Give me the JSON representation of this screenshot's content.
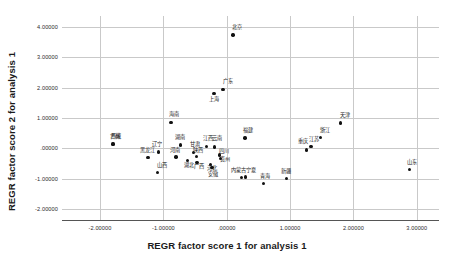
{
  "chart_data": {
    "type": "scatter",
    "title": "",
    "xlabel": "REGR factor score  1 for analysis 1",
    "ylabel": "REGR factor score  2 for analysis 1",
    "xlim": [
      -2.6,
      3.35
    ],
    "ylim": [
      -2.35,
      4.35
    ],
    "xticks": [
      "-2.00000",
      "-1.00000",
      ".00000",
      "1.00000",
      "2.00000",
      "3.00000"
    ],
    "xtick_values": [
      -2,
      -1,
      0,
      1,
      2,
      3
    ],
    "yticks": [
      "4.00000",
      "3.00000",
      "2.00000",
      "1.00000",
      ".00000",
      "-1.00000",
      "-2.00000"
    ],
    "ytick_values": [
      4,
      3,
      2,
      1,
      0,
      -1,
      -2
    ],
    "grid": true,
    "legend": false,
    "point_color": "#111111",
    "grid_color": "#c9c9c9",
    "axis_color": "#555555",
    "points": [
      {
        "label": "北京",
        "x": 0.1,
        "y": 3.73,
        "lx": 0.16,
        "ly": 3.97
      },
      {
        "label": "广东",
        "x": -0.06,
        "y": 1.93,
        "lx": 0.02,
        "ly": 2.17
      },
      {
        "label": "上海",
        "x": -0.2,
        "y": 1.8,
        "lx": -0.2,
        "ly": 1.6
      },
      {
        "label": "海南",
        "x": -0.88,
        "y": 0.86,
        "lx": -0.84,
        "ly": 1.09
      },
      {
        "label": "天津",
        "x": 1.8,
        "y": 0.83,
        "lx": 1.87,
        "ly": 1.07
      },
      {
        "label": "浙江",
        "x": 1.48,
        "y": 0.35,
        "lx": 1.55,
        "ly": 0.58
      },
      {
        "label": "福建",
        "x": 0.29,
        "y": 0.34,
        "lx": 0.33,
        "ly": 0.57
      },
      {
        "label": "江苏",
        "x": 1.33,
        "y": 0.06,
        "lx": 1.38,
        "ly": 0.28
      },
      {
        "label": "重庆",
        "x": 1.26,
        "y": -0.05,
        "lx": 1.21,
        "ly": 0.2
      },
      {
        "label": "西藏",
        "x": -1.79,
        "y": 0.15,
        "lx": -1.75,
        "ly": 0.38
      },
      {
        "label": "湖南",
        "x": -0.73,
        "y": 0.11,
        "lx": -0.73,
        "ly": 0.35
      },
      {
        "label": "江西",
        "x": -0.32,
        "y": 0.07,
        "lx": -0.3,
        "ly": 0.3
      },
      {
        "label": "云南",
        "x": -0.19,
        "y": 0.05,
        "lx": -0.16,
        "ly": 0.3
      },
      {
        "label": "辽宁",
        "x": -1.08,
        "y": -0.12,
        "lx": -1.1,
        "ly": 0.1
      },
      {
        "label": "甘肃",
        "x": -0.52,
        "y": -0.13,
        "lx": -0.5,
        "ly": 0.1
      },
      {
        "label": "黑龙江",
        "x": -1.24,
        "y": -0.3,
        "lx": -1.25,
        "ly": -0.09
      },
      {
        "label": "河南",
        "x": -0.8,
        "y": -0.28,
        "lx": -0.82,
        "ly": -0.09
      },
      {
        "label": "陕西",
        "x": -0.48,
        "y": -0.27,
        "lx": -0.46,
        "ly": -0.08
      },
      {
        "label": "四川",
        "x": -0.11,
        "y": -0.22,
        "lx": -0.05,
        "ly": -0.12
      },
      {
        "label": "湖北",
        "x": -0.62,
        "y": -0.4,
        "lx": -0.6,
        "ly": -0.58
      },
      {
        "label": "贵州",
        "x": -0.1,
        "y": -0.33,
        "lx": -0.03,
        "ly": -0.37
      },
      {
        "label": "山西",
        "x": -1.09,
        "y": -0.78,
        "lx": -1.02,
        "ly": -0.58
      },
      {
        "label": "广西",
        "x": -0.47,
        "y": -0.46,
        "lx": -0.44,
        "ly": -0.6
      },
      {
        "label": "河北",
        "x": -0.26,
        "y": -0.52,
        "lx": -0.23,
        "ly": -0.69
      },
      {
        "label": "安徽",
        "x": -0.23,
        "y": -0.62,
        "lx": -0.22,
        "ly": -0.88
      },
      {
        "label": "内蒙古",
        "x": 0.23,
        "y": -0.95,
        "lx": 0.18,
        "ly": -0.74
      },
      {
        "label": "宁夏",
        "x": 0.3,
        "y": -0.94,
        "lx": 0.38,
        "ly": -0.74
      },
      {
        "label": "青海",
        "x": 0.58,
        "y": -1.16,
        "lx": 0.6,
        "ly": -0.94
      },
      {
        "label": "新疆",
        "x": 0.94,
        "y": -0.99,
        "lx": 0.94,
        "ly": -0.76
      },
      {
        "label": "山东",
        "x": 2.88,
        "y": -0.69,
        "lx": 2.93,
        "ly": -0.48
      },
      {
        "label": "吉林",
        "x": -1.8,
        "y": 0.14,
        "lx": -1.76,
        "ly": 0.37
      }
    ]
  }
}
